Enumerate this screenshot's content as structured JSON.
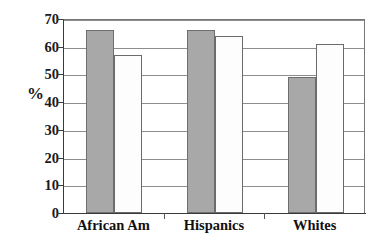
{
  "chart_data": {
    "type": "bar",
    "title": "",
    "xlabel": "",
    "ylabel": "%",
    "categories": [
      "African Am",
      "Hispanics",
      "Whites"
    ],
    "series": [
      {
        "name": "series-1",
        "style": "filled-gray",
        "color": "#a8a8a8",
        "values": [
          66,
          66,
          49
        ]
      },
      {
        "name": "series-2",
        "style": "open-white",
        "color": "#ffffff",
        "values": [
          57,
          64,
          61
        ]
      }
    ],
    "ylim": [
      0,
      70
    ],
    "ytick_labels": [
      "0",
      "10",
      "20",
      "30",
      "40",
      "50",
      "60",
      "70"
    ],
    "ytick_values": [
      0,
      10,
      20,
      30,
      40,
      50,
      60,
      70
    ],
    "grid": true,
    "grid_axis": "y",
    "legend": "none"
  },
  "axis": {
    "y_title": "%"
  }
}
